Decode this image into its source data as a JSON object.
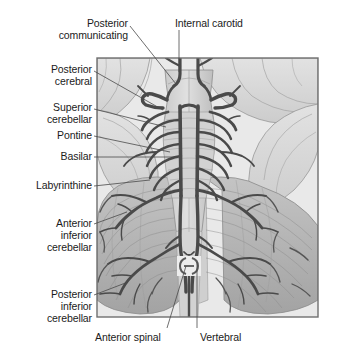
{
  "figure": {
    "type": "anatomical-illustration",
    "style": "grayscale medical diagram",
    "frame": {
      "x": 97,
      "y": 58,
      "width": 221,
      "height": 259,
      "border_color": "#6f6f6f"
    },
    "palette": {
      "page_background": "#ffffff",
      "plate_background": "#e9e9e9",
      "tissue_light": "#dcdcdc",
      "tissue_mid": "#b9b9b9",
      "tissue_dark": "#9a9a9a",
      "vessel": "#4a4a4a",
      "vessel_fine": "#6b6b6b",
      "label_text": "#1b1b1b",
      "leader_line": "#4a4a4a"
    }
  },
  "labels": [
    {
      "id": "posterior-communicating",
      "text_lines": [
        "Posterior",
        "communicating"
      ],
      "align": "right",
      "x": 128,
      "y": 17,
      "leader": [
        [
          130,
          26
        ],
        [
          176,
          84
        ]
      ]
    },
    {
      "id": "internal-carotid",
      "text_lines": [
        "Internal carotid"
      ],
      "align": "left",
      "x": 175,
      "y": 17,
      "leader": [
        [
          179,
          30
        ],
        [
          179,
          72
        ]
      ]
    },
    {
      "id": "posterior-cerebral",
      "text_lines": [
        "Posterior",
        "cerebral"
      ],
      "align": "right",
      "x": 92,
      "y": 63,
      "leader": [
        [
          94,
          71
        ],
        [
          163,
          110
        ]
      ]
    },
    {
      "id": "superior-cerebellar",
      "text_lines": [
        "Superior",
        "cerebellar"
      ],
      "align": "right",
      "x": 92,
      "y": 101,
      "leader": [
        [
          94,
          109
        ],
        [
          166,
          127
        ]
      ]
    },
    {
      "id": "pontine",
      "text_lines": [
        "Pontine"
      ],
      "align": "right",
      "x": 92,
      "y": 129,
      "leader": [
        [
          94,
          136
        ],
        [
          170,
          152
        ]
      ]
    },
    {
      "id": "basilar",
      "text_lines": [
        "Basilar"
      ],
      "align": "right",
      "x": 92,
      "y": 150,
      "leader": [
        [
          94,
          157
        ],
        [
          175,
          157
        ]
      ]
    },
    {
      "id": "labyrinthine",
      "text_lines": [
        "Labyrinthine"
      ],
      "align": "right",
      "x": 92,
      "y": 179,
      "leader": [
        [
          94,
          186
        ],
        [
          150,
          180
        ]
      ]
    },
    {
      "id": "anterior-inferior-cerebellar",
      "text_lines": [
        "Anterior",
        "inferior",
        "cerebellar"
      ],
      "align": "right",
      "x": 92,
      "y": 217,
      "leader": [
        [
          94,
          224
        ],
        [
          127,
          212
        ]
      ]
    },
    {
      "id": "posterior-inferior-cerebellar",
      "text_lines": [
        "Posterior",
        "inferior",
        "cerebellar"
      ],
      "align": "right",
      "x": 92,
      "y": 288,
      "leader": [
        [
          94,
          295
        ],
        [
          128,
          282
        ]
      ]
    },
    {
      "id": "anterior-spinal",
      "text_lines": [
        "Anterior spinal"
      ],
      "align": "left",
      "x": 95,
      "y": 331,
      "leader": [
        [
          167,
          328
        ],
        [
          186,
          266
        ]
      ]
    },
    {
      "id": "vertebral",
      "text_lines": [
        "Vertebral"
      ],
      "align": "left",
      "x": 200,
      "y": 331,
      "leader": [
        [
          197,
          328
        ],
        [
          197,
          262
        ]
      ]
    }
  ],
  "structures": [
    {
      "id": "frontal-lobe-left",
      "name": "Left frontal/orbital lobe"
    },
    {
      "id": "frontal-lobe-right",
      "name": "Right frontal/orbital lobe"
    },
    {
      "id": "temporal-lobe-left",
      "name": "Left temporal lobe"
    },
    {
      "id": "temporal-lobe-right",
      "name": "Right temporal lobe"
    },
    {
      "id": "midbrain",
      "name": "Midbrain / cerebral peduncles"
    },
    {
      "id": "pons",
      "name": "Pons with transverse pontine fibres"
    },
    {
      "id": "medulla",
      "name": "Medulla oblongata"
    },
    {
      "id": "spinal-cord",
      "name": "Upper spinal cord"
    },
    {
      "id": "cerebellum-left",
      "name": "Left cerebellar hemisphere"
    },
    {
      "id": "cerebellum-right",
      "name": "Right cerebellar hemisphere"
    },
    {
      "id": "basilar-artery",
      "name": "Basilar artery"
    },
    {
      "id": "vertebral-artery-left",
      "name": "Left vertebral artery"
    },
    {
      "id": "vertebral-artery-right",
      "name": "Right vertebral artery"
    },
    {
      "id": "anterior-spinal-artery",
      "name": "Anterior spinal artery"
    },
    {
      "id": "internal-carotid-artery",
      "name": "Internal carotid artery"
    },
    {
      "id": "posterior-communicating-artery",
      "name": "Posterior communicating artery"
    },
    {
      "id": "posterior-cerebral-artery",
      "name": "Posterior cerebral artery"
    },
    {
      "id": "superior-cerebellar-artery",
      "name": "Superior cerebellar artery"
    },
    {
      "id": "pontine-arteries",
      "name": "Pontine arteries"
    },
    {
      "id": "labyrinthine-artery",
      "name": "Labyrinthine artery"
    },
    {
      "id": "aica",
      "name": "Anterior inferior cerebellar artery"
    },
    {
      "id": "pica",
      "name": "Posterior inferior cerebellar artery"
    }
  ]
}
